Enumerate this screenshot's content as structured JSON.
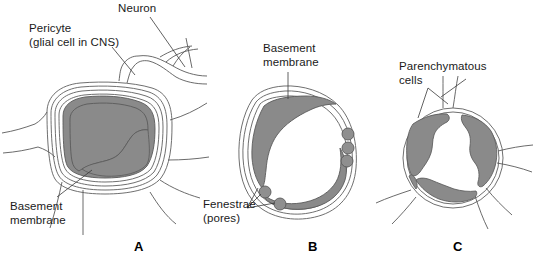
{
  "figure": {
    "width": 541,
    "height": 266,
    "background_color": "#ffffff",
    "line_color": "#4a4a4a",
    "fill_gray": "#8a8a8a",
    "text_color": "#1a1a1a"
  },
  "labels": {
    "pericyte": "Pericyte\n(glial cell in CNS)",
    "neuron": "Neuron",
    "basement_membrane_a": "Basement\nmembrane",
    "basement_membrane_b": "Basement\nmembrane",
    "fenestrae": "Fenestrae\n(pores)",
    "parenchymatous_cells": "Parenchymatous\ncells"
  },
  "panels": [
    {
      "letter": "A",
      "name": "continuous-capillary",
      "labels": [
        "Pericyte (glial cell in CNS)",
        "Neuron",
        "Basement membrane"
      ]
    },
    {
      "letter": "B",
      "name": "fenestrated-capillary",
      "labels": [
        "Basement membrane",
        "Fenestrae (pores)"
      ],
      "fenestrae_count": 5
    },
    {
      "letter": "C",
      "name": "sinusoid-discontinuous-capillary",
      "labels": [
        "Parenchymatous cells"
      ],
      "endothelial_segments": 4
    }
  ]
}
